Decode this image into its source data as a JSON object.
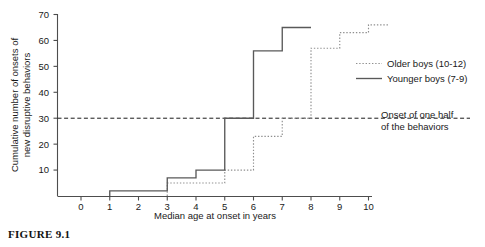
{
  "figure": {
    "caption": "FIGURE 9.1"
  },
  "chart_data": {
    "type": "line",
    "title": "",
    "xlabel": "Median age at onset in years",
    "ylabel": "Cumulative number of onsets of new disruptive behaviors",
    "xlim": [
      -0.6,
      10.7
    ],
    "ylim": [
      0,
      72
    ],
    "xticks": [
      0,
      1,
      2,
      3,
      4,
      5,
      6,
      7,
      8,
      9,
      10
    ],
    "yticks": [
      10,
      20,
      30,
      40,
      50,
      60,
      70
    ],
    "grid": false,
    "legend_position": "right",
    "step_style": "post",
    "series": [
      {
        "name": "Older boys (10-12)",
        "style": "dotted",
        "color": "#8a8a8a",
        "x": [
          3,
          4,
          5,
          6,
          7,
          8,
          9,
          10,
          10.7
        ],
        "y": [
          5,
          5,
          10,
          23,
          30,
          57,
          63,
          66,
          66
        ]
      },
      {
        "name": "Younger boys (7-9)",
        "style": "solid",
        "color": "#4d4d4d",
        "x": [
          1,
          2,
          3,
          4,
          5,
          6,
          7,
          8
        ],
        "y": [
          2,
          2,
          7,
          10,
          30,
          56,
          65,
          65
        ]
      }
    ],
    "reference_line": {
      "value": 30,
      "style": "dashed",
      "label_line1": "Onset of one half",
      "label_line2": "of the behaviors"
    }
  },
  "legend": {
    "items": [
      {
        "label": "Older boys (10-12)",
        "style": "dotted"
      },
      {
        "label": "Younger boys (7-9)",
        "style": "solid"
      }
    ]
  },
  "axis_text": {
    "ylabel_line1": "Cumulative number of onsets of",
    "ylabel_line2": "new disruptive behaviors",
    "xlabel": "Median age at onset in years"
  }
}
